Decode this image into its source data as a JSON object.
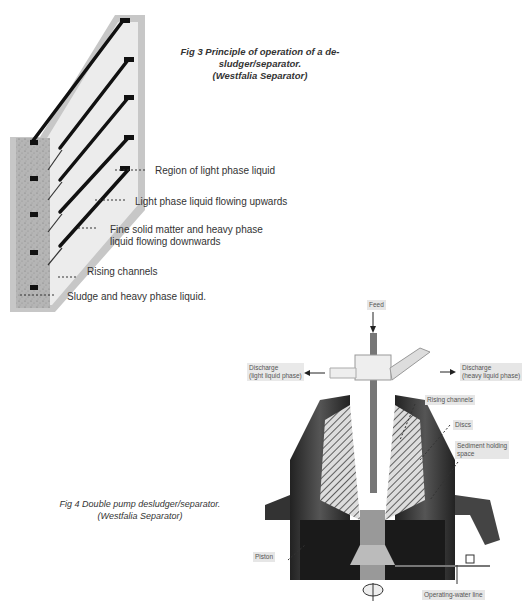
{
  "fig3": {
    "caption_line1": "Fig 3  Principle  of  operation  of  a  de-",
    "caption_line2": "sludger/separator.",
    "caption_line3": "(Westfalia Separator)",
    "labels": [
      "Region of light phase liquid",
      "Light phase liquid flowing upwards",
      "Fine solid matter and heavy phase",
      "liquid flowing downwards",
      "Rising channels",
      "Sludge and heavy phase liquid."
    ]
  },
  "fig4": {
    "caption_line1": "Fig 4 Double pump desludger/separator.",
    "caption_line2": "(Westfalia Separator)",
    "labels": {
      "feed": "Feed",
      "discharge_light_1": "Discharge",
      "discharge_light_2": "(light liquid phase)",
      "discharge_heavy_1": "Discharge",
      "discharge_heavy_2": "(heavy liquid phase)",
      "rising_channels": "Rising channels",
      "discs": "Discs",
      "sediment_1": "Sediment holding",
      "sediment_2": "space",
      "piston": "Piston",
      "operating_water_line": "Operating-water line"
    }
  }
}
